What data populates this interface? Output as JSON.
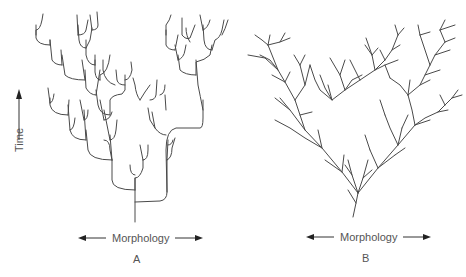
{
  "figure": {
    "panel_a": {
      "label": "A",
      "x_axis_label": "Morphology",
      "style": "punctuated (rectangular branching)"
    },
    "panel_b": {
      "label": "B",
      "x_axis_label": "Morphology",
      "style": "gradual (diagonal branching)"
    },
    "y_axis_label": "Time",
    "colors": {
      "line": "#4a4a4a",
      "text": "#555555",
      "background": "#ffffff"
    }
  }
}
